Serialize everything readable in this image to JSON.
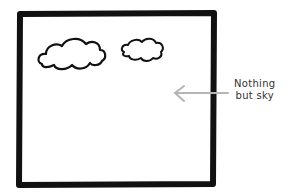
{
  "annotation": {
    "line1": "Nothing",
    "line2": "but sky"
  },
  "colors": {
    "frame": "#111111",
    "arrow": "#b5b5b5",
    "background": "#ffffff"
  }
}
